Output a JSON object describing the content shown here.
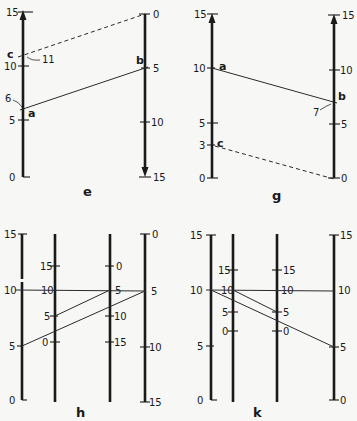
{
  "panels": {
    "e": {
      "caption": "e",
      "left_axis": {
        "ticks": [
          "0",
          "5",
          "10",
          "15"
        ],
        "direction": "up"
      },
      "right_axis": {
        "ticks": [
          "0",
          "5",
          "10",
          "15"
        ],
        "direction": "down"
      },
      "points": {
        "a": "a",
        "b": "b",
        "c": "c"
      },
      "annotations": {
        "a_value": "6",
        "c_value": "11"
      },
      "lines": [
        {
          "from": "a (left 6)",
          "to": "b (right 5)",
          "style": "solid"
        },
        {
          "from": "c (left 11)",
          "to": "right 0",
          "style": "dashed"
        }
      ]
    },
    "g": {
      "caption": "g",
      "left_axis": {
        "ticks": [
          "0",
          "3",
          "5",
          "10",
          "15"
        ],
        "direction": "up"
      },
      "right_axis": {
        "ticks": [
          "0",
          "5",
          "10",
          "15"
        ],
        "direction": "up"
      },
      "points": {
        "a": "a",
        "b": "b",
        "c": "c"
      },
      "annotations": {
        "b_value": "7"
      },
      "lines": [
        {
          "from": "a (left 10)",
          "to": "b (right 7)",
          "style": "solid"
        },
        {
          "from": "c (left 3)",
          "to": "right 0",
          "style": "dashed"
        }
      ]
    },
    "h": {
      "caption": "h",
      "axis1": {
        "ticks": [
          "0",
          "5",
          "10",
          "15"
        ]
      },
      "axis2": {
        "ticks": [
          "0",
          "5",
          "10",
          "15"
        ]
      },
      "axis3": {
        "ticks": [
          "0",
          "5",
          "10",
          "15"
        ]
      },
      "axis4": {
        "ticks": [
          "0",
          "5",
          "10",
          "15"
        ]
      }
    },
    "k": {
      "caption": "k",
      "axis1": {
        "ticks": [
          "0",
          "5",
          "10",
          "15"
        ]
      },
      "axis2": {
        "ticks": [
          "0",
          "5",
          "10",
          "15"
        ]
      },
      "axis3": {
        "ticks": [
          "0",
          "5",
          "10",
          "15"
        ]
      },
      "axis4": {
        "ticks": [
          "0",
          "5",
          "10",
          "15"
        ]
      }
    }
  }
}
